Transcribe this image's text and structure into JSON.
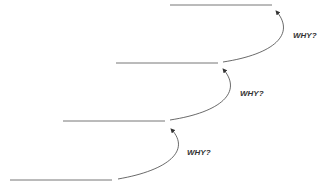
{
  "diagram": {
    "labels": [
      "WHY?",
      "WHY?",
      "WHY?"
    ],
    "line_color": "#555555",
    "arrow_color": "#333333"
  }
}
